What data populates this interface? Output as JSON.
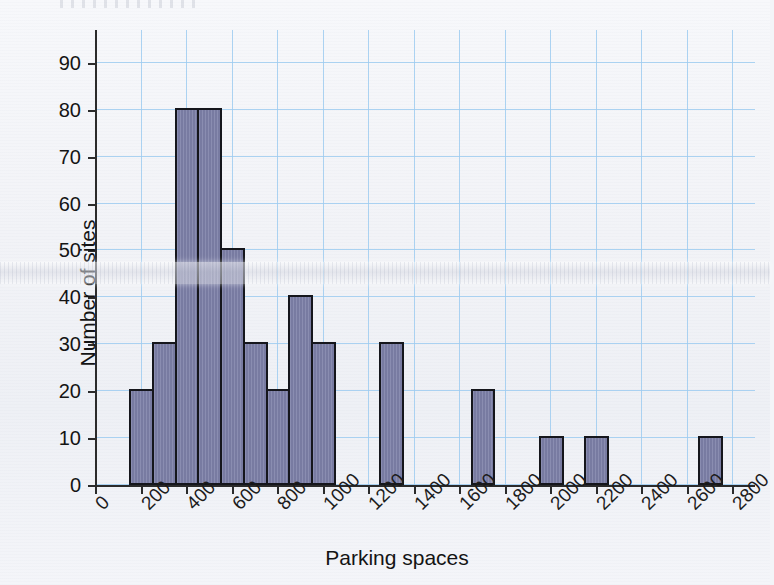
{
  "figure": {
    "kind": "histogram",
    "top_fragment": ""
  },
  "chart_data": {
    "type": "bar",
    "title": "",
    "subtitle": "",
    "xlabel": "Parking spaces",
    "ylabel": "Number of sites",
    "xlim": [
      0,
      2900
    ],
    "ylim": [
      0,
      97
    ],
    "grid": true,
    "legend": null,
    "bin_width": 100,
    "x_tick_labels": [
      "0",
      "200",
      "400",
      "600",
      "800",
      "1000",
      "1200",
      "1400",
      "1600",
      "1800",
      "2000",
      "2200",
      "2400",
      "2600",
      "2800"
    ],
    "x_tick_values": [
      0,
      200,
      400,
      600,
      800,
      1000,
      1200,
      1400,
      1600,
      1800,
      2000,
      2200,
      2400,
      2600,
      2800
    ],
    "y_tick_labels": [
      "0",
      "10",
      "20",
      "30",
      "40",
      "50",
      "60",
      "70",
      "80",
      "90"
    ],
    "y_tick_values": [
      0,
      10,
      20,
      30,
      40,
      50,
      60,
      70,
      80,
      90
    ],
    "bars": [
      {
        "bin_start": 150,
        "bin_end": 250,
        "value": 20
      },
      {
        "bin_start": 250,
        "bin_end": 350,
        "value": 30
      },
      {
        "bin_start": 350,
        "bin_end": 450,
        "value": 80
      },
      {
        "bin_start": 450,
        "bin_end": 550,
        "value": 80
      },
      {
        "bin_start": 550,
        "bin_end": 650,
        "value": 50
      },
      {
        "bin_start": 650,
        "bin_end": 750,
        "value": 30
      },
      {
        "bin_start": 750,
        "bin_end": 850,
        "value": 20
      },
      {
        "bin_start": 850,
        "bin_end": 950,
        "value": 40
      },
      {
        "bin_start": 950,
        "bin_end": 1050,
        "value": 30
      },
      {
        "bin_start": 1250,
        "bin_end": 1350,
        "value": 30
      },
      {
        "bin_start": 1650,
        "bin_end": 1750,
        "value": 20
      },
      {
        "bin_start": 1950,
        "bin_end": 2050,
        "value": 10
      },
      {
        "bin_start": 2150,
        "bin_end": 2250,
        "value": 10
      },
      {
        "bin_start": 2650,
        "bin_end": 2750,
        "value": 10
      }
    ],
    "colors": {
      "bar_fill": "#7d80a8",
      "bar_edge": "#15161c",
      "grid": "#9ecbf0",
      "axis": "#2b2b2b",
      "background": "#f2f3f7",
      "text": "#141414"
    }
  }
}
